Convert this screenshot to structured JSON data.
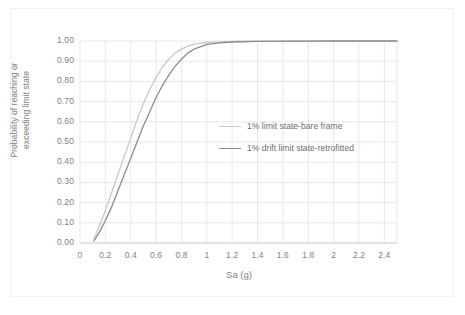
{
  "chart_data": {
    "type": "line",
    "title": "",
    "xlabel": "Sa (g)",
    "ylabel": "Probability of reaching or exceeding limit state",
    "ylabel_line1": "Probability of reaching or",
    "ylabel_line2": "exceeding limit state",
    "xlim": [
      0,
      2.5
    ],
    "ylim": [
      0,
      1.0
    ],
    "grid": true,
    "legend_position": "inside-right",
    "xticks": [
      "0",
      "0.2",
      "0.4",
      "0.6",
      "0.8",
      "1",
      "1.2",
      "1.4",
      "1.6",
      "1.8",
      "2",
      "2.2",
      "2.4"
    ],
    "xtick_values": [
      0,
      0.2,
      0.4,
      0.6,
      0.8,
      1.0,
      1.2,
      1.4,
      1.6,
      1.8,
      2.0,
      2.2,
      2.4
    ],
    "yticks": [
      "0.00",
      "0.10",
      "0.20",
      "0.30",
      "0.40",
      "0.50",
      "0.60",
      "0.70",
      "0.80",
      "0.90",
      "1.00"
    ],
    "ytick_values": [
      0,
      0.1,
      0.2,
      0.3,
      0.4,
      0.5,
      0.6,
      0.7,
      0.8,
      0.9,
      1.0
    ],
    "series": [
      {
        "name": "1% limit state-bare frame",
        "color": "#c9c9c9",
        "width": 1.3,
        "x": [
          0.11,
          0.15,
          0.2,
          0.25,
          0.3,
          0.35,
          0.4,
          0.45,
          0.5,
          0.55,
          0.6,
          0.65,
          0.7,
          0.75,
          0.8,
          0.85,
          0.9,
          1.0,
          1.1,
          1.2,
          1.4,
          1.6,
          1.8,
          2.0,
          2.2,
          2.4,
          2.5
        ],
        "y": [
          0.02,
          0.08,
          0.16,
          0.25,
          0.34,
          0.43,
          0.52,
          0.61,
          0.69,
          0.76,
          0.82,
          0.87,
          0.91,
          0.94,
          0.96,
          0.975,
          0.985,
          0.993,
          0.996,
          0.998,
          0.999,
          0.999,
          1.0,
          1.0,
          1.0,
          1.0,
          1.0
        ]
      },
      {
        "name": "1% drift limit state-retrofitted",
        "color": "#8c8c8c",
        "width": 1.3,
        "x": [
          0.11,
          0.15,
          0.2,
          0.25,
          0.3,
          0.35,
          0.4,
          0.45,
          0.5,
          0.55,
          0.6,
          0.65,
          0.7,
          0.75,
          0.8,
          0.85,
          0.9,
          1.0,
          1.1,
          1.2,
          1.4,
          1.6,
          1.8,
          2.0,
          2.2,
          2.4,
          2.5
        ],
        "y": [
          0.01,
          0.05,
          0.11,
          0.18,
          0.26,
          0.34,
          0.42,
          0.5,
          0.58,
          0.65,
          0.72,
          0.78,
          0.83,
          0.875,
          0.91,
          0.94,
          0.96,
          0.983,
          0.991,
          0.995,
          0.998,
          0.999,
          0.999,
          1.0,
          1.0,
          1.0,
          1.0
        ]
      }
    ],
    "legend": [
      {
        "label": "1% limit state-bare frame",
        "color": "#c9c9c9"
      },
      {
        "label": "1% drift limit state-retrofitted",
        "color": "#8c8c8c"
      }
    ],
    "colors": {
      "grid": "#e8e8e8",
      "axis": "#d9d9d9",
      "text": "#7f7f7f",
      "border": "#f0f0f0",
      "background": "#ffffff"
    }
  }
}
